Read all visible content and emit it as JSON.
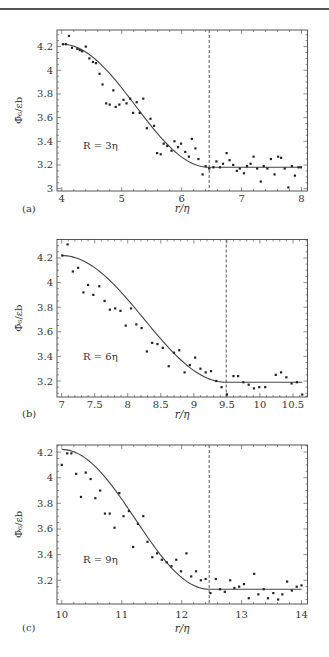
{
  "figure": {
    "ylabel": "Φ̄₆/εb",
    "xlabel": "r/η"
  },
  "chart_data": [
    {
      "type": "scatter",
      "panel_label": "(a)",
      "annotation": "R = 3η",
      "xlabel": "r/η",
      "ylabel": "Φ̄6/εb",
      "xlim": [
        3.92,
        8.1
      ],
      "ylim": [
        2.98,
        4.34
      ],
      "xticks": [
        4,
        5,
        6,
        7,
        8
      ],
      "yticks": [
        3,
        3.2,
        3.4,
        3.6,
        3.8,
        4,
        4.2
      ],
      "ytick_labels": [
        "3",
        "3.2",
        "3.4",
        "3.6",
        "3.8",
        "4",
        "4.2"
      ],
      "vline_x": 6.46,
      "fit": {
        "start": [
          4.0,
          4.22
        ],
        "end_x": 6.46,
        "plateau": 3.18,
        "xmax": 8.0
      },
      "x": [
        4.02,
        4.07,
        4.12,
        4.17,
        4.26,
        4.3,
        4.34,
        4.4,
        4.46,
        4.52,
        4.57,
        4.63,
        4.68,
        4.74,
        4.8,
        4.86,
        4.9,
        4.96,
        5.03,
        5.08,
        5.14,
        5.19,
        5.25,
        5.3,
        5.36,
        5.42,
        5.48,
        5.54,
        5.59,
        5.65,
        5.7,
        5.76,
        5.83,
        5.88,
        5.94,
        5.99,
        6.06,
        6.12,
        6.17,
        6.23,
        6.28,
        6.35,
        6.4,
        6.46,
        6.53,
        6.58,
        6.64,
        6.69,
        6.75,
        6.8,
        6.86,
        6.92,
        6.97,
        7.04,
        7.09,
        7.15,
        7.2,
        7.26,
        7.32,
        7.37,
        7.43,
        7.49,
        7.55,
        7.61,
        7.66,
        7.72,
        7.78,
        7.84,
        7.89,
        7.95,
        7.99
      ],
      "y": [
        4.22,
        4.22,
        4.29,
        4.19,
        4.18,
        4.17,
        4.16,
        4.2,
        4.1,
        4.07,
        4.06,
        3.97,
        3.88,
        3.72,
        3.71,
        3.83,
        3.69,
        3.71,
        3.75,
        3.72,
        3.76,
        3.64,
        3.73,
        3.64,
        3.76,
        3.51,
        3.59,
        3.53,
        3.3,
        3.29,
        3.38,
        3.36,
        3.32,
        3.4,
        3.35,
        3.38,
        3.31,
        3.27,
        3.42,
        3.34,
        3.25,
        3.12,
        3.19,
        3.17,
        3.18,
        3.23,
        3.18,
        3.21,
        3.3,
        3.24,
        3.2,
        3.15,
        3.17,
        3.13,
        3.19,
        3.21,
        3.27,
        3.17,
        3.06,
        3.19,
        3.17,
        3.25,
        3.12,
        3.27,
        3.26,
        3.17,
        3.01,
        3.19,
        3.11,
        3.18,
        3.18
      ]
    },
    {
      "type": "scatter",
      "panel_label": "(b)",
      "annotation": "R = 6η",
      "xlabel": "r/η",
      "ylabel": "Φ̄6/εb",
      "xlim": [
        6.93,
        10.72
      ],
      "ylim": [
        3.07,
        4.35
      ],
      "xticks": [
        7,
        7.5,
        8,
        8.5,
        9,
        9.5,
        10,
        10.5
      ],
      "yticks": [
        3.2,
        3.4,
        3.6,
        3.8,
        4,
        4.2
      ],
      "ytick_labels": [
        "3.2",
        "3.4",
        "3.6",
        "3.8",
        "4",
        "4.2"
      ],
      "vline_x": 9.49,
      "fit": {
        "start": [
          7.0,
          4.22
        ],
        "end_x": 9.49,
        "plateau": 3.19,
        "xmax": 10.64
      },
      "x": [
        7.01,
        7.09,
        7.17,
        7.25,
        7.33,
        7.4,
        7.48,
        7.57,
        7.65,
        7.73,
        7.81,
        7.89,
        7.97,
        8.05,
        8.13,
        8.21,
        8.29,
        8.37,
        8.45,
        8.53,
        8.62,
        8.7,
        8.78,
        8.86,
        8.94,
        9.02,
        9.1,
        9.18,
        9.26,
        9.34,
        9.42,
        9.5,
        9.6,
        9.67,
        9.75,
        9.83,
        9.91,
        9.99,
        10.08,
        10.24,
        10.32,
        10.4,
        10.48,
        10.56,
        10.64
      ],
      "y": [
        4.22,
        4.31,
        4.09,
        4.12,
        3.92,
        3.98,
        3.9,
        3.97,
        3.85,
        3.78,
        3.79,
        3.77,
        3.65,
        3.79,
        3.66,
        3.63,
        3.44,
        3.51,
        3.5,
        3.47,
        3.32,
        3.43,
        3.45,
        3.27,
        3.33,
        3.39,
        3.3,
        3.27,
        3.28,
        3.2,
        3.15,
        3.09,
        3.24,
        3.24,
        3.19,
        3.17,
        3.14,
        3.15,
        3.15,
        3.25,
        3.27,
        3.23,
        3.18,
        3.19,
        3.09
      ]
    },
    {
      "type": "scatter",
      "panel_label": "(c)",
      "annotation": "R = 9η",
      "xlabel": "r/η",
      "ylabel": "Φ̄6/εb",
      "xlim": [
        9.92,
        14.1
      ],
      "ylim": [
        3.015,
        4.255
      ],
      "xticks": [
        10,
        11,
        12,
        13,
        14
      ],
      "yticks": [
        3.2,
        3.4,
        3.6,
        3.8,
        4,
        4.2
      ],
      "ytick_labels": [
        "3.2",
        "3.4",
        "3.6",
        "3.8",
        "4",
        "4.2"
      ],
      "vline_x": 12.46,
      "fit": {
        "start": [
          10.0,
          4.22
        ],
        "end_x": 12.46,
        "plateau": 3.13,
        "xmax": 14.0
      },
      "x": [
        10.0,
        10.09,
        10.16,
        10.24,
        10.32,
        10.4,
        10.48,
        10.56,
        10.64,
        10.72,
        10.8,
        10.88,
        10.96,
        11.03,
        11.12,
        11.19,
        11.27,
        11.36,
        11.43,
        11.51,
        11.59,
        11.67,
        11.75,
        11.83,
        11.91,
        11.99,
        12.08,
        12.16,
        12.24,
        12.32,
        12.4,
        12.48,
        12.57,
        12.64,
        12.72,
        12.81,
        12.88,
        12.96,
        13.04,
        13.12,
        13.21,
        13.28,
        13.37,
        13.44,
        13.53,
        13.61,
        13.68,
        13.76,
        13.84,
        13.92,
        14.0
      ],
      "y": [
        4.1,
        4.19,
        4.19,
        4.03,
        3.85,
        4.04,
        3.99,
        3.84,
        3.9,
        3.72,
        3.72,
        3.61,
        3.88,
        3.7,
        3.74,
        3.46,
        3.64,
        3.7,
        3.5,
        3.38,
        3.41,
        3.36,
        3.34,
        3.31,
        3.36,
        3.27,
        3.41,
        3.23,
        3.27,
        3.2,
        3.21,
        3.1,
        3.21,
        3.13,
        3.11,
        3.2,
        3.14,
        3.15,
        3.17,
        3.06,
        3.25,
        3.09,
        3.13,
        3.06,
        3.1,
        3.05,
        3.09,
        3.19,
        3.12,
        3.15,
        3.16
      ]
    }
  ],
  "layout": {
    "panels": [
      {
        "top": 0,
        "frame": {
          "x0": 57,
          "x1": 307.5,
          "y0": 30,
          "y1": 191
        },
        "xlabel_y": 212,
        "ticklabel_y": 202,
        "annot": {
          "x": 83,
          "y": 149
        },
        "plabel": {
          "x": 22,
          "y": 212
        }
      },
      {
        "top": 0,
        "frame": {
          "x0": 57,
          "x1": 307.5,
          "y0": 239.5,
          "y1": 397
        },
        "xlabel_y": 418,
        "ticklabel_y": 408,
        "annot": {
          "x": 83,
          "y": 360
        },
        "plabel": {
          "x": 22,
          "y": 417
        }
      },
      {
        "top": 0,
        "frame": {
          "x0": 57,
          "x1": 307.5,
          "y0": 445,
          "y1": 604
        },
        "xlabel_y": 632,
        "ticklabel_y": 618,
        "annot": {
          "x": 83,
          "y": 563
        },
        "plabel": {
          "x": 22,
          "y": 631
        }
      }
    ]
  }
}
